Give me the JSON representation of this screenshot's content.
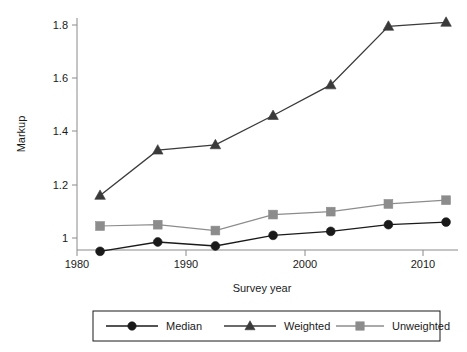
{
  "chart_data": {
    "type": "line",
    "title": "",
    "xlabel": "Survey year",
    "ylabel": "Markup",
    "x": [
      1982,
      1987,
      1992,
      1997,
      2002,
      2007,
      2012
    ],
    "xlim": [
      1980,
      2013.5
    ],
    "ylim": [
      0.94,
      1.85
    ],
    "xticks": [
      1980,
      1990,
      2000,
      2010
    ],
    "xticklabels": [
      "1980",
      "1990",
      "2000",
      "2010"
    ],
    "yticks": [
      1,
      1.2,
      1.4,
      1.6,
      1.8
    ],
    "yticklabels": [
      "1",
      "1.2",
      "1.4",
      "1.6",
      "1.8"
    ],
    "grid": false,
    "legend_position": "below",
    "series": [
      {
        "name": "Median",
        "marker": "circle",
        "color": "#1a1a1a",
        "values": [
          0.95,
          0.985,
          0.97,
          1.01,
          1.025,
          1.05,
          1.06
        ]
      },
      {
        "name": "Weighted",
        "marker": "triangle",
        "color": "#3a3a3a",
        "values": [
          1.16,
          1.33,
          1.35,
          1.46,
          1.575,
          1.795,
          1.81
        ]
      },
      {
        "name": "Unweighted",
        "marker": "square",
        "color": "#8c8c8c",
        "values": [
          1.045,
          1.05,
          1.028,
          1.088,
          1.099,
          1.128,
          1.142
        ]
      }
    ]
  },
  "axes": {
    "y_title": "Markup",
    "x_title": "Survey year",
    "x_tick_labels": [
      "1980",
      "1990",
      "2000",
      "2010"
    ],
    "y_tick_labels": [
      "1",
      "1.2",
      "1.4",
      "1.6",
      "1.8"
    ]
  },
  "legend": {
    "items": [
      {
        "label": "Median",
        "marker": "circle-marker",
        "color": "#1a1a1a"
      },
      {
        "label": "Weighted",
        "marker": "triangle-marker",
        "color": "#3a3a3a"
      },
      {
        "label": "Unweighted",
        "marker": "square-marker",
        "color": "#8c8c8c"
      }
    ]
  }
}
